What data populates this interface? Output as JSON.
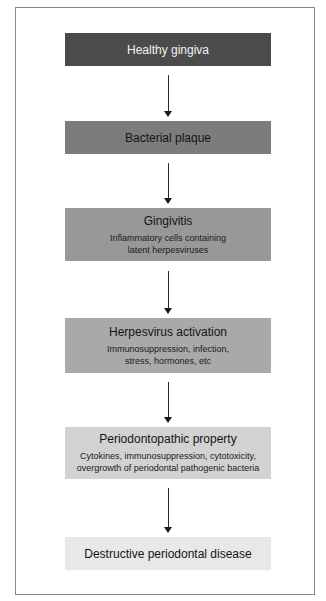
{
  "diagram": {
    "type": "flowchart",
    "direction": "top-to-bottom",
    "nodes": [
      {
        "id": "healthy-gingiva",
        "title": "Healthy gingiva",
        "desc": null,
        "fill": "#4b4b4b",
        "text_color": "#f2f2f2"
      },
      {
        "id": "bacterial-plaque",
        "title": "Bacterial plaque",
        "desc": null,
        "fill": "#7c7c7c",
        "text_color": "#151515"
      },
      {
        "id": "gingivitis",
        "title": "Gingivitis",
        "desc_lines": [
          "Inflammatory cells containing",
          "latent herpesviruses"
        ],
        "fill": "#989898",
        "text_color": "#151515"
      },
      {
        "id": "herpesvirus-activation",
        "title": "Herpesvirus activation",
        "desc_lines": [
          "Immunosuppression, infection,",
          "stress, hormones, etc"
        ],
        "fill": "#a9a9a9",
        "text_color": "#151515"
      },
      {
        "id": "periodontopathic-property",
        "title": "Periodontopathic property",
        "desc_lines": [
          "Cytokines, immunosuppression, cytotoxicity,",
          "overgrowth of periodontal pathogenic bacteria"
        ],
        "fill": "#d2d2d2",
        "text_color": "#151515"
      },
      {
        "id": "destructive-periodontal-disease",
        "title": "Destructive periodontal disease",
        "desc": null,
        "fill": "#e8e8e8",
        "text_color": "#151515"
      }
    ],
    "edges": [
      {
        "from": "healthy-gingiva",
        "to": "bacterial-plaque"
      },
      {
        "from": "bacterial-plaque",
        "to": "gingivitis"
      },
      {
        "from": "gingivitis",
        "to": "herpesvirus-activation"
      },
      {
        "from": "herpesvirus-activation",
        "to": "periodontopathic-property"
      },
      {
        "from": "periodontopathic-property",
        "to": "destructive-periodontal-disease"
      }
    ]
  },
  "colors": {
    "frame_border": "#8a8a8a",
    "arrow": "#1a1a1a",
    "background": "#ffffff"
  }
}
